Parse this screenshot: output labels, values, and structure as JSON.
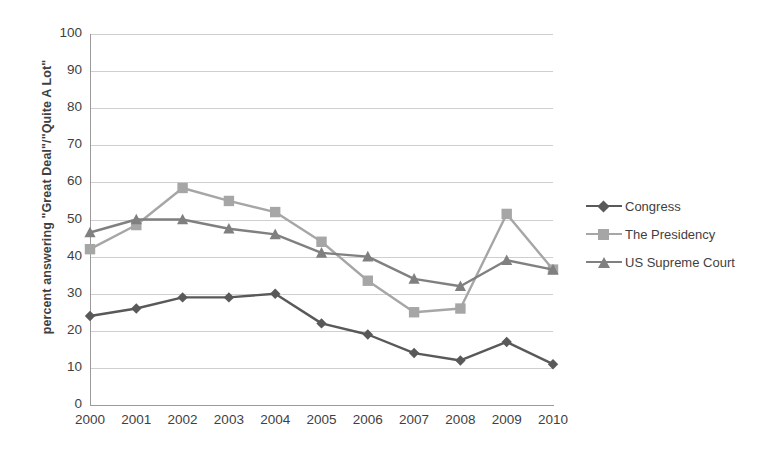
{
  "chart_data": {
    "type": "line",
    "title": "",
    "xlabel": "",
    "ylabel": "percent answering \"Great Deal\"/\"Quite A Lot\"",
    "categories": [
      "2000",
      "2001",
      "2002",
      "2003",
      "2004",
      "2005",
      "2006",
      "2007",
      "2008",
      "2009",
      "2010"
    ],
    "x": [
      2000,
      2001,
      2002,
      2003,
      2004,
      2005,
      2006,
      2007,
      2008,
      2009,
      2010
    ],
    "ylim": [
      0,
      100
    ],
    "yticks": [
      0,
      10,
      20,
      30,
      40,
      50,
      60,
      70,
      80,
      90,
      100
    ],
    "grid": true,
    "legend_position": "right",
    "series": [
      {
        "name": "Congress",
        "marker": "diamond",
        "color": "#595959",
        "values": [
          24,
          26,
          29,
          29,
          30,
          22,
          19,
          14,
          12,
          17,
          11
        ]
      },
      {
        "name": "The Presidency",
        "marker": "square",
        "color": "#a6a6a6",
        "values": [
          42,
          48.5,
          58.5,
          55,
          52,
          44,
          33.5,
          25,
          26,
          51.5,
          36.5
        ]
      },
      {
        "name": "US Supreme Court",
        "marker": "triangle",
        "color": "#808080",
        "values": [
          46.5,
          50,
          50,
          47.5,
          46,
          41,
          40,
          34,
          32,
          39,
          36.5
        ]
      }
    ]
  },
  "legend": {
    "items": [
      {
        "label": "Congress"
      },
      {
        "label": "The Presidency"
      },
      {
        "label": "US Supreme Court"
      }
    ]
  },
  "colors": {
    "congress": "#595959",
    "presidency": "#a6a6a6",
    "supreme_court": "#808080",
    "grid": "#cfcfcf",
    "axis": "#9a9a9a",
    "text": "#3f3f3f",
    "background": "#ffffff"
  }
}
